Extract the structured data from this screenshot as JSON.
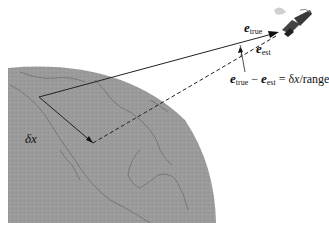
{
  "figure": {
    "colors": {
      "globe_fill": "#9a9a9a",
      "coastline": "#6a6a6a",
      "lines": "#222222",
      "background": "#ffffff"
    },
    "labels": {
      "e_true": {
        "symbol": "e",
        "subscript": "true"
      },
      "e_est": {
        "symbol": "e",
        "subscript": "est"
      },
      "equation": {
        "lhs_a_symbol": "e",
        "lhs_a_subscript": "true",
        "minus": "−",
        "lhs_b_symbol": "e",
        "lhs_b_subscript": "est",
        "equals": " = ",
        "rhs_delta": "δ",
        "rhs_x": "x",
        "rhs_rest": "/range"
      },
      "delta_x": {
        "delta": "δ",
        "x": "x"
      }
    },
    "elements": {
      "satellite": "satellite-icon",
      "globe": "earth-globe",
      "true_vector": "solid line from ground point to satellite",
      "est_vector": "dashed line from offset ground point to satellite",
      "offset": "solid segment between ground points (δx)"
    }
  }
}
